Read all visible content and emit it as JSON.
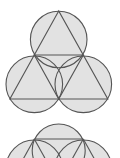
{
  "canvas": {
    "width": 120,
    "height": 158,
    "background": "#ffffff"
  },
  "style": {
    "fill": "#e2e2e2",
    "stroke": "#555555",
    "stroke_width": 1.1
  },
  "figures": [
    {
      "name": "three-circles-four-triangles",
      "circles": [
        {
          "cx": 58.7,
          "cy": 39.5,
          "r": 28.3
        },
        {
          "cx": 34.3,
          "cy": 84.3,
          "r": 28.3
        },
        {
          "cx": 83.3,
          "cy": 84.3,
          "r": 28.3
        }
      ],
      "triangle_outer": [
        [
          58.7,
          11
        ],
        [
          9.9,
          99
        ],
        [
          107.8,
          99
        ]
      ],
      "triangle_inner": [
        [
          34.3,
          55
        ],
        [
          83.3,
          55
        ],
        [
          58.7,
          99
        ]
      ]
    },
    {
      "name": "partial-figure-cropped",
      "offset_y": 84,
      "circles": [
        {
          "cx": 58.7,
          "cy": 150.5,
          "r": 26.5
        },
        {
          "cx": 34.3,
          "cy": 168.3,
          "r": 28.3
        },
        {
          "cx": 83.3,
          "cy": 168.3,
          "r": 28.3
        }
      ],
      "chord": [
        [
          34.3,
          139
        ],
        [
          83.3,
          139
        ]
      ],
      "lines": [
        [
          [
            34.3,
            139
          ],
          [
            9.9,
            183
          ]
        ],
        [
          [
            34.3,
            139
          ],
          [
            58.7,
            183
          ]
        ],
        [
          [
            83.3,
            139
          ],
          [
            58.7,
            183
          ]
        ],
        [
          [
            83.3,
            139
          ],
          [
            107.8,
            183
          ]
        ]
      ]
    }
  ]
}
